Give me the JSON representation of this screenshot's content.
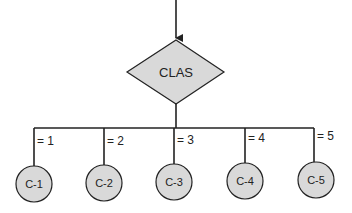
{
  "diagram": {
    "type": "flowchart-case",
    "decision": {
      "label": "CLAS",
      "fill": "#d9d9d9",
      "stroke": "#222222"
    },
    "branches": [
      {
        "condition": "= 1",
        "target": "C-1"
      },
      {
        "condition": "= 2",
        "target": "C-2"
      },
      {
        "condition": "= 3",
        "target": "C-3"
      },
      {
        "condition": "= 4",
        "target": "C-4"
      },
      {
        "condition": "= 5",
        "target": "C-5"
      }
    ],
    "node_fill": "#d9d9d9",
    "line_color": "#222222"
  }
}
